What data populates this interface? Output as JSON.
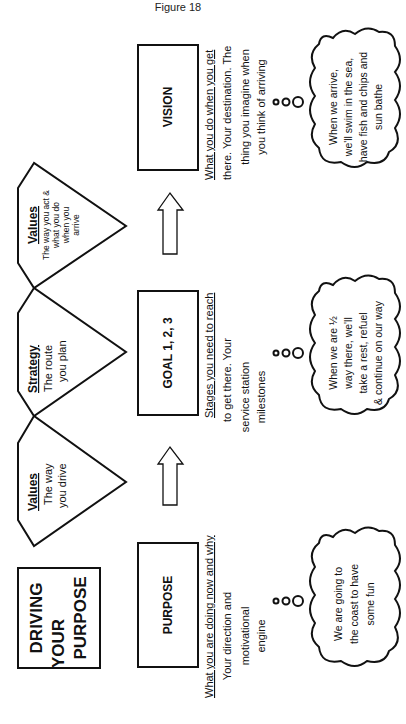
{
  "figure_title": "Figure 18",
  "title_box": {
    "lines": [
      "DRIVING",
      "YOUR",
      "PURPOSE"
    ]
  },
  "stages": [
    {
      "id": "purpose",
      "label": "PURPOSE",
      "heading": "What you are doing now and why",
      "description": [
        "Your direction and",
        "motivational",
        "engine"
      ],
      "thought": [
        "We are going to",
        "the coast to have",
        "some fun"
      ]
    },
    {
      "id": "goal",
      "label": "GOAL 1, 2, 3",
      "heading": "Stages you need to reach",
      "description": [
        "to get there. Your",
        "service station",
        "milestones"
      ],
      "thought": [
        "When we are ½",
        "way there, we'll",
        "take a rest, refuel",
        "& continue on our way"
      ]
    },
    {
      "id": "vision",
      "label": "VISION",
      "heading": "What you do when you get",
      "description": [
        "there. Your destination. The",
        "thing you imagine when",
        "you think of arriving"
      ],
      "thought": [
        "When we arrive,",
        "we'll swim in the sea,",
        "have fish and chips and",
        "sun bathe"
      ]
    }
  ],
  "pentagons": [
    {
      "id": "values-1",
      "title": "Values",
      "text": [
        "The way",
        "you drive"
      ]
    },
    {
      "id": "strategy",
      "title": "Strategy",
      "text": [
        "The route",
        "you plan"
      ]
    },
    {
      "id": "values-2",
      "title": "Values",
      "text": [
        "The way you act &",
        "what you do",
        "when you",
        "arrive"
      ]
    }
  ],
  "arrows": [
    {
      "from": "purpose",
      "to": "goal",
      "icon": "up-arrow-icon"
    },
    {
      "from": "goal",
      "to": "vision",
      "icon": "up-arrow-icon"
    }
  ],
  "colors": {
    "stroke": "#111111",
    "background": "#ffffff"
  }
}
